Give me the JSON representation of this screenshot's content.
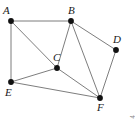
{
  "figure": {
    "width": 135,
    "height": 119,
    "background_color": "#ffffff",
    "edge_color": "#6e6e6e",
    "vertex_color": "#111111",
    "label_color": "#1a1a1a",
    "attribution": "© Cengage Learning 2014",
    "attribution_color": "#8a8a8a"
  },
  "chart_data": {
    "type": "diagram",
    "subtype": "undirected-graph",
    "title": "",
    "nodes": [
      {
        "id": "A",
        "label": "A",
        "x": 11,
        "y": 21,
        "label_dx": -8,
        "label_dy": -16,
        "degree": 3
      },
      {
        "id": "B",
        "label": "B",
        "x": 71,
        "y": 21,
        "label_dx": -3,
        "label_dy": -16,
        "degree": 4
      },
      {
        "id": "C",
        "label": "C",
        "x": 57,
        "y": 68,
        "label_dx": -4,
        "label_dy": -16,
        "degree": 4
      },
      {
        "id": "D",
        "label": "D",
        "x": 116,
        "y": 50,
        "label_dx": -3,
        "label_dy": -16,
        "degree": 2
      },
      {
        "id": "E",
        "label": "E",
        "x": 11,
        "y": 82,
        "label_dx": -6,
        "label_dy": 5,
        "degree": 3
      },
      {
        "id": "F",
        "label": "F",
        "x": 100,
        "y": 98,
        "label_dx": -3,
        "label_dy": 4,
        "degree": 4
      }
    ],
    "edges": [
      {
        "from": "A",
        "to": "B"
      },
      {
        "from": "A",
        "to": "E"
      },
      {
        "from": "A",
        "to": "C"
      },
      {
        "from": "B",
        "to": "C"
      },
      {
        "from": "B",
        "to": "D"
      },
      {
        "from": "B",
        "to": "F"
      },
      {
        "from": "C",
        "to": "E"
      },
      {
        "from": "C",
        "to": "F"
      },
      {
        "from": "D",
        "to": "F"
      },
      {
        "from": "E",
        "to": "F"
      }
    ],
    "node_count": 6,
    "edge_count": 10,
    "labels": [
      "A",
      "B",
      "C",
      "D",
      "E",
      "F"
    ]
  }
}
